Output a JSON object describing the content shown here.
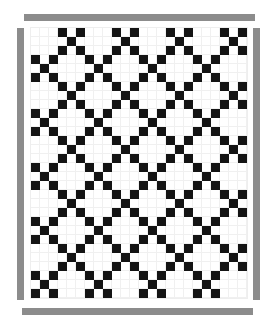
{
  "image": {
    "description": "Quilt pattern diagram: Irish-chain style layout of X (five-patch) blocks on a white field, framed by gray border strips",
    "colors": {
      "dark": "#141414",
      "light": "#ffffff",
      "border": "#8c8c8c",
      "seam": "#f0f0f0"
    }
  },
  "quilt": {
    "cell_size_px": 9,
    "block_size_cells": 3,
    "blocks_across": 8,
    "blocks_down": 10,
    "cells_across": 24,
    "cells_down": 30,
    "x_block_pattern": [
      [
        1,
        0,
        1
      ],
      [
        0,
        1,
        0
      ],
      [
        1,
        0,
        1
      ]
    ],
    "x_block_rule": "block is X-patterned when (block_row + block_col) is odd"
  },
  "borders": [
    "top",
    "left",
    "right",
    "bottom"
  ]
}
